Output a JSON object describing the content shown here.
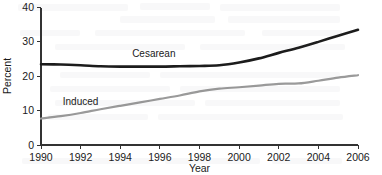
{
  "chart_data": {
    "type": "line",
    "title": "",
    "subtitle": "",
    "xlabel": "Year",
    "ylabel": "Percent",
    "xlim": [
      1990,
      2006
    ],
    "ylim": [
      0,
      40
    ],
    "xticks": [
      "1990",
      "1992",
      "1994",
      "1996",
      "1998",
      "2000",
      "2002",
      "2004",
      "2006"
    ],
    "yticks": [
      "0",
      "10",
      "20",
      "30",
      "40"
    ],
    "grid": false,
    "legend_position": "inline-annotation",
    "x": [
      1990,
      1991,
      1992,
      1993,
      1994,
      1995,
      1996,
      1997,
      1998,
      1999,
      2000,
      2001,
      2002,
      2003,
      2004,
      2005,
      2006
    ],
    "series": [
      {
        "name": "Cesarean",
        "color": "#1c1c1c",
        "label_x": 1994.6,
        "label_y": 25.6,
        "values": [
          23.5,
          23.4,
          23.2,
          22.9,
          22.8,
          22.8,
          22.8,
          22.9,
          23.0,
          23.2,
          24.0,
          25.2,
          26.8,
          28.3,
          30.0,
          31.8,
          33.5
        ]
      },
      {
        "name": "Induced",
        "color": "#9a9a9a",
        "label_x": 1991.1,
        "label_y": 11.5,
        "values": [
          7.7,
          8.4,
          9.3,
          10.4,
          11.4,
          12.4,
          13.4,
          14.4,
          15.6,
          16.4,
          16.8,
          17.3,
          17.8,
          17.9,
          18.7,
          19.6,
          20.3
        ]
      }
    ]
  }
}
